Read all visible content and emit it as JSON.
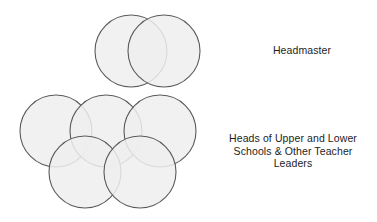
{
  "diagram": {
    "background_color": "#ffffff",
    "circle_fill_color": "#efefef",
    "circle_stroke_color": "#5a5a5a",
    "circle_stroke_width": 1.1,
    "text_color": "#1d1d1d",
    "groups": [
      {
        "id": "headmaster-group",
        "label": "Headmaster",
        "circle_count": 2,
        "circles": [
          {
            "name": "headmaster-circle-left",
            "cx": 131,
            "cy": 51,
            "r": 36
          },
          {
            "name": "headmaster-circle-right",
            "cx": 164,
            "cy": 51,
            "r": 36
          }
        ]
      },
      {
        "id": "heads-group",
        "label": "Heads of Upper and Lower Schools & Other Teacher Leaders",
        "label_lines": [
          "Heads of Upper and Lower",
          "Schools & Other Teacher",
          "Leaders"
        ],
        "circle_count": 5,
        "circles": [
          {
            "name": "heads-circle-back-left",
            "cx": 56,
            "cy": 131,
            "r": 36
          },
          {
            "name": "heads-circle-back-center",
            "cx": 106,
            "cy": 131,
            "r": 36
          },
          {
            "name": "heads-circle-back-right",
            "cx": 160,
            "cy": 131,
            "r": 36
          },
          {
            "name": "heads-circle-front-left",
            "cx": 85,
            "cy": 172,
            "r": 36
          },
          {
            "name": "heads-circle-front-right",
            "cx": 140,
            "cy": 172,
            "r": 36
          }
        ]
      }
    ],
    "labels": {
      "headmaster": "Headmaster",
      "heads": "Heads of Upper and Lower\nSchools & Other Teacher\nLeaders"
    }
  }
}
